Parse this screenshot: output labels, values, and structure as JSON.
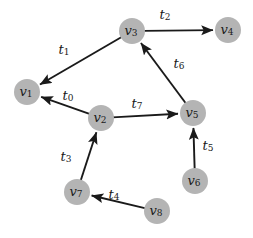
{
  "figure": {
    "kind": "directed-graph-diagram",
    "background_color": "#ffffff",
    "node_fill_color": "#b4b4b4",
    "edge_color": "#1a1a1a",
    "text_color": "#1a1a1a",
    "node_radius": 13,
    "width": 253,
    "height": 238
  },
  "nodes": [
    {
      "id": "v1",
      "base": "v",
      "sub": "1",
      "x": 27,
      "y": 92
    },
    {
      "id": "v2",
      "base": "v",
      "sub": "2",
      "x": 101,
      "y": 118
    },
    {
      "id": "v3",
      "base": "v",
      "sub": "3",
      "x": 132,
      "y": 31
    },
    {
      "id": "v4",
      "base": "v",
      "sub": "4",
      "x": 228,
      "y": 30
    },
    {
      "id": "v5",
      "base": "v",
      "sub": "5",
      "x": 193,
      "y": 113
    },
    {
      "id": "v6",
      "base": "v",
      "sub": "6",
      "x": 195,
      "y": 181
    },
    {
      "id": "v7",
      "base": "v",
      "sub": "7",
      "x": 77,
      "y": 192
    },
    {
      "id": "v8",
      "base": "v",
      "sub": "8",
      "x": 157,
      "y": 211
    }
  ],
  "edges": [
    {
      "id": "t0",
      "base": "t",
      "sub": "0",
      "from": "v2",
      "to": "v1",
      "label_x": 68,
      "label_y": 95
    },
    {
      "id": "t1",
      "base": "t",
      "sub": "1",
      "from": "v3",
      "to": "v1",
      "label_x": 64,
      "label_y": 49
    },
    {
      "id": "t2",
      "base": "t",
      "sub": "2",
      "from": "v3",
      "to": "v4",
      "label_x": 165,
      "label_y": 14
    },
    {
      "id": "t3",
      "base": "t",
      "sub": "3",
      "from": "v7",
      "to": "v2",
      "label_x": 66,
      "label_y": 156
    },
    {
      "id": "t4",
      "base": "t",
      "sub": "4",
      "from": "v8",
      "to": "v7",
      "label_x": 114,
      "label_y": 194
    },
    {
      "id": "t5",
      "base": "t",
      "sub": "5",
      "from": "v6",
      "to": "v5",
      "label_x": 208,
      "label_y": 145
    },
    {
      "id": "t6",
      "base": "t",
      "sub": "6",
      "from": "v5",
      "to": "v3",
      "label_x": 179,
      "label_y": 63
    },
    {
      "id": "t7",
      "base": "t",
      "sub": "7",
      "from": "v2",
      "to": "v5",
      "label_x": 137,
      "label_y": 103
    }
  ]
}
